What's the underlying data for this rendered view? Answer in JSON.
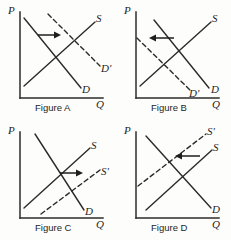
{
  "page": {
    "background_color": "#fdfdfb",
    "ink_color": "#2b2b2b"
  },
  "axis_labels": {
    "price": "P",
    "quantity": "Q"
  },
  "figures": [
    {
      "id": "figure-a",
      "caption": "Figure A",
      "shift": "demand-right",
      "arrow_direction": "right",
      "curves": [
        {
          "name": "supply",
          "label": "S",
          "style": "solid",
          "slope": "upward"
        },
        {
          "name": "demand",
          "label": "D",
          "style": "solid",
          "slope": "downward"
        },
        {
          "name": "demand-shifted",
          "label": "D'",
          "style": "dashed",
          "slope": "downward"
        }
      ]
    },
    {
      "id": "figure-b",
      "caption": "Figure B",
      "shift": "demand-left",
      "arrow_direction": "left",
      "curves": [
        {
          "name": "supply",
          "label": "S",
          "style": "solid",
          "slope": "upward"
        },
        {
          "name": "demand",
          "label": "D",
          "style": "solid",
          "slope": "downward"
        },
        {
          "name": "demand-shifted",
          "label": "D'",
          "style": "dashed",
          "slope": "downward"
        }
      ]
    },
    {
      "id": "figure-c",
      "caption": "Figure C",
      "shift": "supply-right",
      "arrow_direction": "right",
      "curves": [
        {
          "name": "supply",
          "label": "S",
          "style": "solid",
          "slope": "upward"
        },
        {
          "name": "supply-shifted",
          "label": "S'",
          "style": "dashed",
          "slope": "upward"
        },
        {
          "name": "demand",
          "label": "D",
          "style": "solid",
          "slope": "downward"
        }
      ]
    },
    {
      "id": "figure-d",
      "caption": "Figure D",
      "shift": "supply-left",
      "arrow_direction": "left",
      "curves": [
        {
          "name": "supply",
          "label": "S",
          "style": "solid",
          "slope": "upward"
        },
        {
          "name": "supply-shifted",
          "label": "S'",
          "style": "dashed",
          "slope": "upward"
        },
        {
          "name": "demand",
          "label": "D",
          "style": "solid",
          "slope": "downward"
        }
      ]
    }
  ]
}
